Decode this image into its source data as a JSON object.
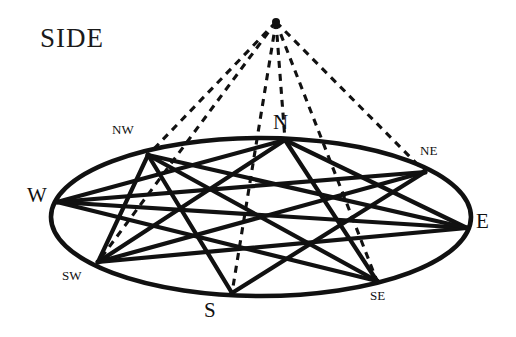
{
  "figure": {
    "title": "SIDE",
    "ink_color": "#111111",
    "background_color": "#ffffff",
    "apex": {
      "x": 276,
      "y": 22
    },
    "ellipse": {
      "cx": 261,
      "cy": 217,
      "rx": 210,
      "ry": 79
    },
    "points": [
      {
        "id": "N",
        "label": "N",
        "size": "major",
        "x": 285,
        "y": 140,
        "label_x": 273,
        "label_y": 110
      },
      {
        "id": "NE",
        "label": "NE",
        "size": "minor",
        "x": 425,
        "y": 172,
        "label_x": 420,
        "label_y": 143
      },
      {
        "id": "E",
        "label": "E",
        "size": "major",
        "x": 467,
        "y": 228,
        "label_x": 476,
        "label_y": 209
      },
      {
        "id": "SE",
        "label": "SE",
        "size": "minor",
        "x": 377,
        "y": 281,
        "label_x": 370,
        "label_y": 288
      },
      {
        "id": "S",
        "label": "S",
        "size": "major",
        "x": 232,
        "y": 293,
        "label_x": 204,
        "label_y": 298
      },
      {
        "id": "SW",
        "label": "SW",
        "size": "minor",
        "x": 98,
        "y": 262,
        "label_x": 62,
        "label_y": 268
      },
      {
        "id": "W",
        "label": "W",
        "size": "major",
        "x": 57,
        "y": 202,
        "label_x": 27,
        "label_y": 183
      },
      {
        "id": "NW",
        "label": "NW",
        "size": "minor",
        "x": 148,
        "y": 155,
        "label_x": 112,
        "label_y": 122
      }
    ],
    "chords": [
      [
        "N",
        "SE"
      ],
      [
        "N",
        "SW"
      ],
      [
        "N",
        "E"
      ],
      [
        "N",
        "W"
      ],
      [
        "NE",
        "SW"
      ],
      [
        "NE",
        "S"
      ],
      [
        "NE",
        "W"
      ],
      [
        "E",
        "SW"
      ],
      [
        "E",
        "W"
      ],
      [
        "E",
        "NW"
      ],
      [
        "SE",
        "NW"
      ],
      [
        "SE",
        "W"
      ],
      [
        "S",
        "NW"
      ],
      [
        "SW",
        "NW"
      ]
    ],
    "dashed_rays": [
      {
        "to": "NW"
      },
      {
        "to": "N"
      },
      {
        "to": "NE"
      },
      {
        "to": "SW"
      },
      {
        "to": "S"
      },
      {
        "to": "SE"
      }
    ],
    "title_position": {
      "x": 40,
      "y": 23
    }
  }
}
